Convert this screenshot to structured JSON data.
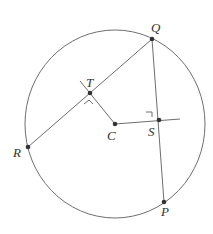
{
  "diagram": {
    "type": "circle-geometry",
    "circle": {
      "center_label": "C",
      "cx": 115,
      "cy": 124,
      "rx": 90,
      "ry": 94
    },
    "points": {
      "Q": {
        "label": "Q",
        "x": 152,
        "y": 39,
        "lx": 151,
        "ly": 32
      },
      "T": {
        "label": "T",
        "x": 90,
        "y": 93,
        "lx": 86,
        "ly": 87
      },
      "C": {
        "label": "C",
        "x": 115,
        "y": 124,
        "lx": 107,
        "ly": 140
      },
      "S": {
        "label": "S",
        "x": 159,
        "y": 120,
        "lx": 148,
        "ly": 136
      },
      "R": {
        "label": "R",
        "x": 28,
        "y": 147,
        "lx": 13,
        "ly": 157
      },
      "P": {
        "label": "P",
        "x": 164,
        "y": 202,
        "lx": 161,
        "ly": 216
      }
    },
    "segments": [
      "RQ",
      "QP",
      "TC",
      "CS"
    ],
    "right_angles": [
      "T",
      "S"
    ],
    "colors": {
      "line": "#6e6e6e",
      "point": "#333333",
      "text": "#333333"
    }
  }
}
